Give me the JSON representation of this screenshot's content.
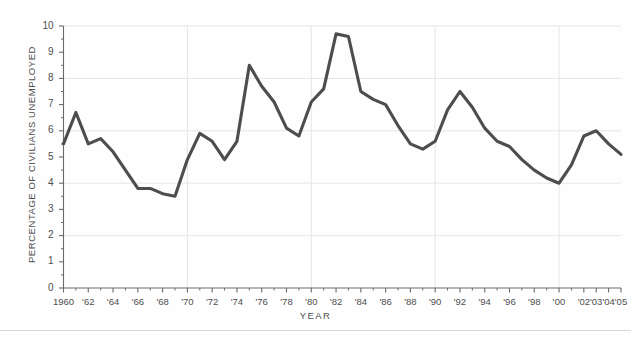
{
  "chart_data": {
    "type": "line",
    "title": "",
    "xlabel": "YEAR",
    "ylabel": "PERCENTAGE OF CIVILIANS UNEMPLOYED",
    "xlim": [
      1960,
      2005
    ],
    "ylim": [
      0,
      10
    ],
    "grid": "horizontal-major",
    "legend": "none",
    "line_color": "#4d4d4d",
    "gridline_color": "#e6e6e6",
    "axis_color": "#6b6b6b",
    "x": [
      1960,
      1961,
      1962,
      1963,
      1964,
      1965,
      1966,
      1967,
      1968,
      1969,
      1970,
      1971,
      1972,
      1973,
      1974,
      1975,
      1976,
      1977,
      1978,
      1979,
      1980,
      1981,
      1982,
      1983,
      1984,
      1985,
      1986,
      1987,
      1988,
      1989,
      1990,
      1991,
      1992,
      1993,
      1994,
      1995,
      1996,
      1997,
      1998,
      1999,
      2000,
      2001,
      2002,
      2003,
      2004,
      2005
    ],
    "values": [
      5.5,
      6.7,
      5.5,
      5.7,
      5.2,
      4.5,
      3.8,
      3.8,
      3.6,
      3.5,
      4.9,
      5.9,
      5.6,
      4.9,
      5.6,
      8.5,
      7.7,
      7.1,
      6.1,
      5.8,
      7.1,
      7.6,
      9.7,
      9.6,
      7.5,
      7.2,
      7.0,
      6.2,
      5.5,
      5.3,
      5.6,
      6.8,
      7.5,
      6.9,
      6.1,
      5.6,
      5.4,
      4.9,
      4.5,
      4.2,
      4.0,
      4.7,
      5.8,
      6.0,
      5.5,
      5.1
    ],
    "y_ticks": [
      0,
      1,
      2,
      3,
      4,
      5,
      6,
      7,
      8,
      9,
      10
    ],
    "y_tick_labels": [
      "0",
      "1",
      "2",
      "3",
      "4",
      "5",
      "6",
      "7",
      "8",
      "9",
      "10"
    ],
    "x_ticks": [
      1960,
      1962,
      1964,
      1966,
      1968,
      1970,
      1972,
      1974,
      1976,
      1978,
      1980,
      1982,
      1984,
      1986,
      1988,
      1990,
      1992,
      1994,
      1996,
      1998,
      2000,
      2002,
      2003,
      2004,
      2005
    ],
    "x_tick_labels": [
      "1960",
      "'62",
      "'64",
      "'66",
      "'68",
      "'70",
      "'72",
      "'74",
      "'76",
      "'78",
      "'80",
      "'82",
      "'84",
      "'86",
      "'88",
      "'90",
      "'92",
      "'94",
      "'96",
      "'98",
      "'00",
      "'02",
      "'03",
      "'04",
      "'05"
    ]
  }
}
